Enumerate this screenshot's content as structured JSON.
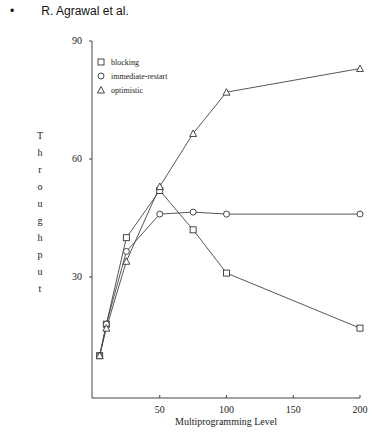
{
  "header": {
    "bullet": "•",
    "author": "R. Agrawal et al."
  },
  "chart_data": {
    "type": "line",
    "title": "",
    "xlabel": "Multiprogramming Level",
    "ylabel": "Throughput",
    "x": [
      5,
      10,
      25,
      50,
      75,
      100,
      200
    ],
    "series": [
      {
        "name": "blocking",
        "marker": "square",
        "values": [
          10,
          18,
          40,
          52,
          42,
          31,
          17
        ]
      },
      {
        "name": "immediate-restart",
        "marker": "circle",
        "values": [
          10,
          18,
          36.5,
          46,
          46.5,
          46,
          46
        ]
      },
      {
        "name": "optimistic",
        "marker": "triangle",
        "values": [
          10,
          17,
          34,
          53,
          66.5,
          77,
          83
        ]
      }
    ],
    "xlim": [
      0,
      200
    ],
    "ylim": [
      0,
      90
    ],
    "xticks": [
      50,
      100,
      150,
      200
    ],
    "yticks": [
      30,
      60,
      90
    ],
    "grid": false,
    "legend_position": "upper-left"
  },
  "legend": {
    "items": [
      {
        "label": "blocking",
        "marker": "square"
      },
      {
        "label": "immediate-restart",
        "marker": "circle"
      },
      {
        "label": "optimistic",
        "marker": "triangle"
      }
    ]
  },
  "axes": {
    "x_tick_labels": [
      "50",
      "100",
      "150",
      "200"
    ],
    "y_tick_labels": [
      "30",
      "60",
      "90"
    ],
    "ylabel_letters": [
      "T",
      "h",
      "r",
      "o",
      "u",
      "g",
      "h",
      "p",
      "u",
      "t"
    ]
  }
}
